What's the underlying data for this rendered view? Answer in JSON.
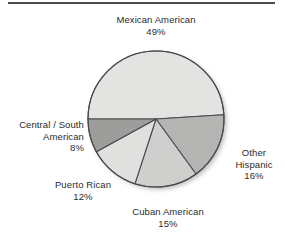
{
  "figure": {
    "has_top_rule": true,
    "background_color": "#ffffff",
    "text_color": "#2b2b2b"
  },
  "chart_data": {
    "type": "pie",
    "title": "",
    "subtitle": "",
    "xlabel": "",
    "ylabel": "",
    "legend_position": "none",
    "labels_position": "outside",
    "grid": false,
    "start_angle_deg": 180,
    "direction": "clockwise",
    "units": "percent",
    "total": 100,
    "categories": [
      "Mexican American",
      "Other Hispanic",
      "Cuban American",
      "Puerto Rican",
      "Central / South American"
    ],
    "values": [
      49,
      16,
      15,
      12,
      8
    ],
    "value_labels": [
      "49%",
      "16%",
      "15%",
      "12%",
      "8%"
    ],
    "colors": [
      "#e3e3e1",
      "#b4b4b2",
      "#cfcfcd",
      "#e0e0de",
      "#9d9d9b"
    ],
    "slice_outline_color": "#4a4a4a",
    "slices": [
      {
        "name": "Mexican American",
        "value": 49,
        "value_label": "49%",
        "color": "#e3e3e1",
        "label_lines": [
          "Mexican American",
          "49%"
        ]
      },
      {
        "name": "Other Hispanic",
        "value": 16,
        "value_label": "16%",
        "color": "#b4b4b2",
        "label_lines": [
          "Other",
          "Hispanic",
          "16%"
        ]
      },
      {
        "name": "Cuban American",
        "value": 15,
        "value_label": "15%",
        "color": "#cfcfcd",
        "label_lines": [
          "Cuban American",
          "15%"
        ]
      },
      {
        "name": "Puerto Rican",
        "value": 12,
        "value_label": "12%",
        "color": "#e0e0de",
        "label_lines": [
          "Puerto Rican",
          "12%"
        ]
      },
      {
        "name": "Central / South American",
        "value": 8,
        "value_label": "8%",
        "color": "#9d9d9b",
        "label_lines": [
          "Central / South",
          "American",
          "8%"
        ]
      }
    ]
  },
  "labels": {
    "mexican": {
      "line1": "Mexican American",
      "line2": "49%"
    },
    "other_hispanic": {
      "line1": "Other",
      "line2": "Hispanic",
      "line3": "16%"
    },
    "cuban": {
      "line1": "Cuban American",
      "line2": "15%"
    },
    "puerto_rican": {
      "line1": "Puerto Rican",
      "line2": "12%"
    },
    "central_south": {
      "line1": "Central / South",
      "line2": "American",
      "line3": "8%"
    }
  }
}
